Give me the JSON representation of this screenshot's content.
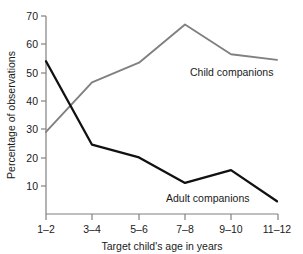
{
  "chart_data": {
    "type": "line",
    "title": "",
    "xlabel": "Target child's age in years",
    "ylabel": "Percentage of observations",
    "categories": [
      "1–2",
      "3–4",
      "5–6",
      "7–8",
      "9–10",
      "11–12"
    ],
    "yticks": [
      "10",
      "20",
      "30",
      "40",
      "50",
      "60",
      "70"
    ],
    "ytick_values": [
      10,
      20,
      30,
      40,
      50,
      60,
      70
    ],
    "ylim": [
      0,
      70
    ],
    "grid": false,
    "legend_position": "inline-annotations",
    "series": [
      {
        "name": "Child companions",
        "color": "#808080",
        "values": [
          29,
          46.5,
          53.5,
          67,
          56.5,
          54.5
        ],
        "label": "Child companions"
      },
      {
        "name": "Adult companions",
        "color": "#111111",
        "values": [
          54,
          24.5,
          20,
          11,
          15.5,
          4.5
        ],
        "label": "Adult companions"
      }
    ],
    "annotations": [
      {
        "text": "Child companions",
        "series": "Child companions"
      },
      {
        "text": "Adult companions",
        "series": "Adult companions"
      }
    ]
  },
  "axis": {
    "color": "#808080",
    "ylabel": "Percentage of observations",
    "xlabel": "Target child's age in years"
  }
}
